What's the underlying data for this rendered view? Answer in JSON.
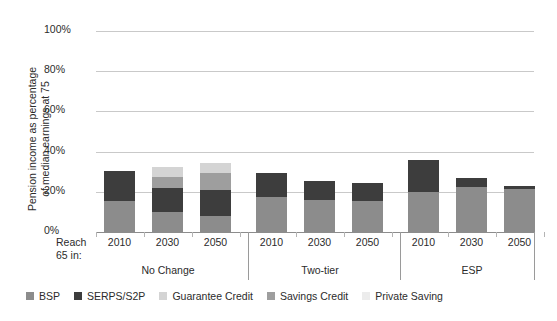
{
  "chart_data": {
    "type": "bar",
    "title": "",
    "subtitle": "",
    "xlabel": "",
    "ylabel": "Pension income as percentage of median earnings at 75",
    "ylabel_lines": [
      "Pension income as percentage",
      "of median earnings at 75"
    ],
    "ylim": [
      0,
      100
    ],
    "yticks": [
      0,
      20,
      40,
      60,
      80,
      100
    ],
    "ytick_labels": [
      "0%",
      "20%",
      "40%",
      "60%",
      "80%",
      "100%"
    ],
    "grid": true,
    "stacked": true,
    "legend_position": "bottom",
    "axis_prefix": "Reach 65 in:",
    "axis_prefix_lines": [
      "Reach",
      "65 in:"
    ],
    "groups": [
      "No Change",
      "Two-tier",
      "ESP"
    ],
    "categories": [
      "2010",
      "2030",
      "2050",
      "2010",
      "2030",
      "2050",
      "2010",
      "2030",
      "2050"
    ],
    "series": [
      {
        "name": "BSP",
        "color": "#8c8c8c",
        "values": [
          15.4,
          10.0,
          8.0,
          17.4,
          16.0,
          15.5,
          20.0,
          22.5,
          21.5
        ]
      },
      {
        "name": "SERPS/S2P",
        "color": "#3d3d3d",
        "values": [
          15.0,
          12.0,
          13.0,
          11.9,
          9.5,
          9.0,
          16.0,
          4.5,
          1.5
        ]
      },
      {
        "name": "Guarantee Credit",
        "color": "#d4d4d4",
        "values": [
          0.0,
          5.0,
          5.0,
          0.0,
          0.0,
          0.0,
          0.0,
          0.0,
          0.0
        ]
      },
      {
        "name": "Savings Credit",
        "color": "#9e9e9e",
        "values": [
          0.0,
          5.5,
          8.5,
          0.0,
          0.0,
          0.0,
          0.0,
          0.0,
          0.0
        ]
      },
      {
        "name": "Private Saving",
        "color": "#ececec",
        "values": [
          0.0,
          0.0,
          0.0,
          0.0,
          0.0,
          0.0,
          0.0,
          0.0,
          0.0
        ]
      }
    ],
    "totals": [
      30.4,
      32.5,
      34.5,
      29.3,
      25.5,
      24.5,
      36.0,
      27.0,
      23.0
    ]
  },
  "legend": {
    "items": [
      {
        "label": "BSP",
        "color": "#8c8c8c"
      },
      {
        "label": "SERPS/S2P",
        "color": "#3d3d3d"
      },
      {
        "label": "Guarantee Credit",
        "color": "#d4d4d4"
      },
      {
        "label": "Savings Credit",
        "color": "#9e9e9e"
      },
      {
        "label": "Private Saving",
        "color": "#ececec"
      }
    ]
  },
  "colors": {
    "gridline": "#c9c9c9",
    "axis": "#8c8c8c",
    "text": "#2b2b2b",
    "background": "#ffffff"
  }
}
